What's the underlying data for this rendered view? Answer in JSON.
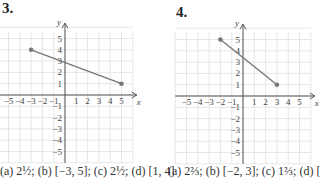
{
  "problems": [
    {
      "number": "3.",
      "answer": "(a) 2½; (b) [−3, 5]; (c) 2½; (d) [1, 4]"
    },
    {
      "number": "4.",
      "answer": "(a) 2⅔; (b) [−2, 3]; (c) 1⅔; (d) ["
    }
  ],
  "chart_data": [
    {
      "type": "line",
      "title": "3.",
      "xlabel": "x",
      "ylabel": "y",
      "xlim": [
        -6,
        6
      ],
      "ylim": [
        -6,
        6
      ],
      "x_ticks": [
        -5,
        -4,
        -3,
        -2,
        -1,
        1,
        2,
        3,
        4,
        5
      ],
      "y_ticks": [
        -5,
        -4,
        -3,
        -2,
        -1,
        1,
        2,
        3,
        4,
        5
      ],
      "grid": true,
      "series": [
        {
          "name": "segment",
          "points": [
            [
              -3,
              4
            ],
            [
              5,
              1
            ]
          ]
        }
      ]
    },
    {
      "type": "line",
      "title": "4.",
      "xlabel": "x",
      "ylabel": "y",
      "xlim": [
        -6,
        6
      ],
      "ylim": [
        -6,
        6
      ],
      "x_ticks": [
        -5,
        -4,
        -3,
        -2,
        -1,
        1,
        2,
        3,
        4,
        5
      ],
      "y_ticks": [
        -5,
        -4,
        -3,
        -2,
        -1,
        1,
        2,
        3,
        4,
        5
      ],
      "grid": true,
      "series": [
        {
          "name": "segment",
          "points": [
            [
              -2,
              5
            ],
            [
              3,
              1
            ]
          ]
        }
      ]
    }
  ]
}
